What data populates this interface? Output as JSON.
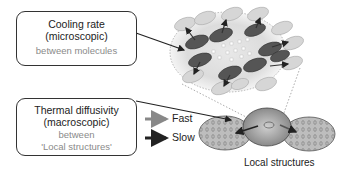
{
  "boxes": {
    "micro": {
      "title1": "Cooling rate",
      "title2": "(microscopic)",
      "sub": "between molecules"
    },
    "macro": {
      "title1": "Thermal diffusivity",
      "title2": "(macroscopic)",
      "sub1": "between",
      "sub2": "'Local structures'"
    }
  },
  "legend": {
    "fast": {
      "label": "Fast",
      "color": "#888888"
    },
    "slow": {
      "label": "Slow",
      "color": "#222222"
    }
  },
  "caption": "Local structures"
}
